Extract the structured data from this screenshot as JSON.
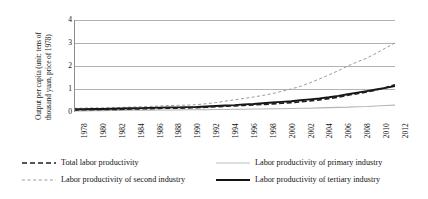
{
  "chart_data": {
    "type": "line",
    "title": "",
    "xlabel": "",
    "ylabel_line1": "Output per capita (unit: tens of",
    "ylabel_line2": "thousand yuan, price of 1978)",
    "ylabel": "Output per capita (unit: tens of thousand yuan, price of 1978)",
    "ylim": [
      0,
      4
    ],
    "yticks": [
      4,
      3,
      2,
      1,
      0
    ],
    "grid": true,
    "legend_position": "bottom",
    "xlim": [
      1978,
      2012
    ],
    "x": [
      1978,
      1979,
      1980,
      1981,
      1982,
      1983,
      1984,
      1985,
      1986,
      1987,
      1988,
      1989,
      1990,
      1991,
      1992,
      1993,
      1994,
      1995,
      1996,
      1997,
      1998,
      1999,
      2000,
      2001,
      2002,
      2003,
      2004,
      2005,
      2006,
      2007,
      2008,
      2009,
      2010,
      2011,
      2012
    ],
    "xtick_labels": [
      "1978",
      "1980",
      "1982",
      "1984",
      "1986",
      "1988",
      "1990",
      "1992",
      "1994",
      "1996",
      "1998",
      "2000",
      "2002",
      "2004",
      "2006",
      "2008",
      "2010",
      "2012"
    ],
    "xtick_values": [
      1978,
      1980,
      1982,
      1984,
      1986,
      1988,
      1990,
      1992,
      1994,
      1996,
      1998,
      2000,
      2002,
      2004,
      2006,
      2008,
      2010,
      2012
    ],
    "series": [
      {
        "name": "Total labor productivity",
        "style": "bold-dashed",
        "color": "#1f1f1f",
        "values": [
          0.09,
          0.1,
          0.1,
          0.11,
          0.11,
          0.12,
          0.13,
          0.14,
          0.15,
          0.16,
          0.17,
          0.17,
          0.18,
          0.19,
          0.21,
          0.23,
          0.25,
          0.27,
          0.29,
          0.31,
          0.33,
          0.35,
          0.38,
          0.41,
          0.44,
          0.48,
          0.53,
          0.58,
          0.65,
          0.73,
          0.8,
          0.87,
          0.96,
          1.06,
          1.18
        ]
      },
      {
        "name": "Labor productivity of second industry",
        "style": "light-dashed",
        "color": "#9a9a9a",
        "values": [
          0.16,
          0.17,
          0.18,
          0.18,
          0.19,
          0.2,
          0.21,
          0.23,
          0.24,
          0.26,
          0.28,
          0.29,
          0.3,
          0.32,
          0.36,
          0.41,
          0.47,
          0.53,
          0.59,
          0.65,
          0.72,
          0.8,
          0.9,
          1.0,
          1.12,
          1.27,
          1.44,
          1.61,
          1.8,
          2.0,
          2.18,
          2.34,
          2.55,
          2.78,
          3.0
        ]
      },
      {
        "name": "Labor productivity of primary industry",
        "style": "light-solid",
        "color": "#b4b4b4",
        "values": [
          0.05,
          0.05,
          0.06,
          0.06,
          0.07,
          0.07,
          0.08,
          0.08,
          0.08,
          0.09,
          0.09,
          0.09,
          0.1,
          0.1,
          0.1,
          0.11,
          0.11,
          0.12,
          0.12,
          0.13,
          0.13,
          0.14,
          0.14,
          0.15,
          0.16,
          0.16,
          0.18,
          0.19,
          0.2,
          0.21,
          0.23,
          0.24,
          0.26,
          0.28,
          0.3
        ]
      },
      {
        "name": "Labor productivity of tertiary industry",
        "style": "bold-solid",
        "color": "#141414",
        "values": [
          0.12,
          0.12,
          0.13,
          0.13,
          0.14,
          0.15,
          0.16,
          0.17,
          0.18,
          0.19,
          0.2,
          0.2,
          0.21,
          0.22,
          0.24,
          0.26,
          0.28,
          0.3,
          0.33,
          0.35,
          0.38,
          0.41,
          0.44,
          0.47,
          0.51,
          0.55,
          0.59,
          0.64,
          0.7,
          0.77,
          0.84,
          0.91,
          0.98,
          1.05,
          1.13
        ]
      }
    ]
  },
  "legend": {
    "items": [
      {
        "label": "Total labor productivity",
        "marker": "bold-dashed-line-icon"
      },
      {
        "label": "Labor productivity of primary industry",
        "marker": "light-solid-line-icon"
      },
      {
        "label": "Labor productivity of second industry",
        "marker": "light-dashed-line-icon"
      },
      {
        "label": "Labor productivity of tertiary industry",
        "marker": "bold-solid-line-icon"
      }
    ]
  },
  "colors": {
    "axis": "#8c8c8c",
    "grid": "#9e9e9e",
    "total": "#1f1f1f",
    "second": "#9a9a9a",
    "primary": "#b4b4b4",
    "tertiary": "#141414",
    "background": "#ffffff"
  }
}
